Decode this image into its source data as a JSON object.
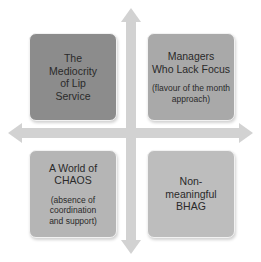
{
  "diagram": {
    "type": "2x2-matrix",
    "axis_color": "#cfcfcf",
    "quadrants": [
      {
        "position": "top-left",
        "title": "The\nMediocrity\nof Lip\nService",
        "subtitle": "",
        "color": "#8c8c8c"
      },
      {
        "position": "top-right",
        "title": "Managers\nWho Lack Focus",
        "subtitle": "(flavour of the month\napproach)",
        "color": "#a9a9a9"
      },
      {
        "position": "bottom-left",
        "title": "A World of\nCHAOS",
        "subtitle": "(absence of\ncoordination\nand support)",
        "color": "#b5b5b5"
      },
      {
        "position": "bottom-right",
        "title": "Non-\nmeaningful\nBHAG",
        "subtitle": "",
        "color": "#bdbdbd"
      }
    ],
    "arrows": [
      "up",
      "down",
      "left",
      "right"
    ]
  }
}
